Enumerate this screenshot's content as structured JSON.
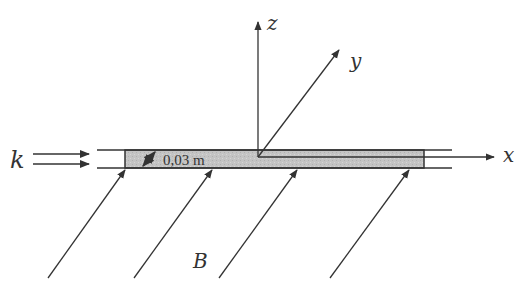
{
  "diagram": {
    "axes": {
      "x_label": "x",
      "y_label": "y",
      "z_label": "z"
    },
    "current_label": "k",
    "field_label": "B",
    "width_dimension": "0,03 m",
    "colors": {
      "line": "#333333",
      "strip_fill": "#c8c8c8",
      "background": "#ffffff"
    }
  }
}
